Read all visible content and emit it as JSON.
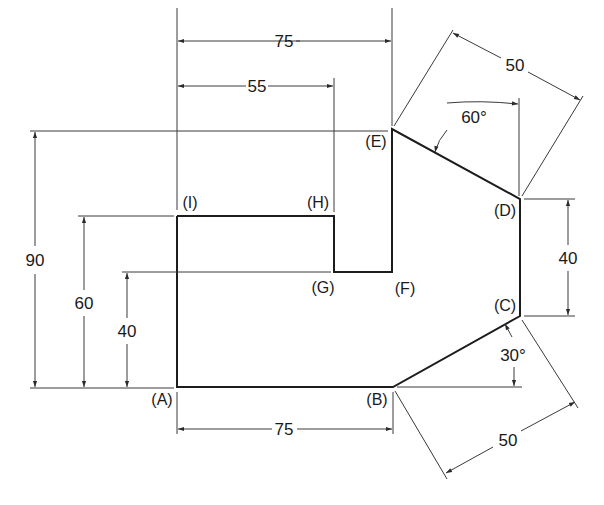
{
  "figure": {
    "type": "technical-drawing",
    "units": "mm",
    "colors": {
      "line": "#1c1c1c",
      "dim_line": "#3a3a3a",
      "text": "#1a1a1a",
      "background": "#ffffff"
    }
  },
  "vertices": {
    "A": {
      "label": "(A)"
    },
    "B": {
      "label": "(B)"
    },
    "C": {
      "label": "(C)"
    },
    "D": {
      "label": "(D)"
    },
    "E": {
      "label": "(E)"
    },
    "F": {
      "label": "(F)"
    },
    "G": {
      "label": "(G)"
    },
    "H": {
      "label": "(H)"
    },
    "I": {
      "label": "(I)"
    }
  },
  "dimensions": {
    "top_EI_width": {
      "value": "75",
      "from": "I",
      "to": "E"
    },
    "top_IH_width": {
      "value": "55",
      "from": "I",
      "to": "H"
    },
    "upper_right_ED_length": {
      "value": "50",
      "from": "E",
      "to": "D"
    },
    "angle_at_D": {
      "value": "60°"
    },
    "right_DC_height": {
      "value": "40",
      "from": "D",
      "to": "C"
    },
    "angle_at_C": {
      "value": "30°"
    },
    "lower_right_BC_length": {
      "value": "50",
      "from": "B",
      "to": "C"
    },
    "bottom_AB_width": {
      "value": "75",
      "from": "A",
      "to": "B"
    },
    "left_total_height": {
      "value": "90",
      "from": "A",
      "to": "E"
    },
    "left_AI_height": {
      "value": "60",
      "from": "A",
      "to": "I"
    },
    "left_AG_height": {
      "value": "40",
      "from": "A",
      "to": "G"
    }
  }
}
